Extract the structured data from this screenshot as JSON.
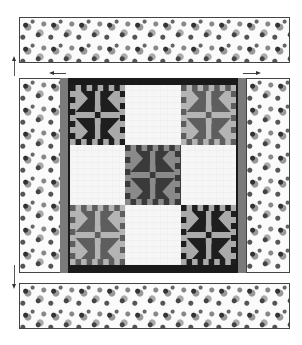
{
  "diagram": {
    "title": "",
    "colors": {
      "dark": "#1a1a1a",
      "medium": "#6f6f6f",
      "light": "#b0b0b0",
      "plain": "#f6f6f6",
      "sashing": "#7a7a7a"
    },
    "borders": {
      "top": {
        "label": "floral-border-top",
        "pattern": "floral print"
      },
      "bottom": {
        "label": "floral-border-bottom",
        "pattern": "floral print"
      },
      "left": {
        "label": "floral-border-left",
        "pattern": "floral print"
      },
      "right": {
        "label": "floral-border-right",
        "pattern": "floral print"
      }
    },
    "blocks": [
      {
        "row": 0,
        "col": 0,
        "type": "pieced",
        "tone": "dark"
      },
      {
        "row": 0,
        "col": 1,
        "type": "plain"
      },
      {
        "row": 0,
        "col": 2,
        "type": "pieced",
        "tone": "medium"
      },
      {
        "row": 1,
        "col": 0,
        "type": "plain"
      },
      {
        "row": 1,
        "col": 1,
        "type": "pieced",
        "tone": "medium-dark"
      },
      {
        "row": 1,
        "col": 2,
        "type": "plain"
      },
      {
        "row": 2,
        "col": 0,
        "type": "pieced",
        "tone": "medium"
      },
      {
        "row": 2,
        "col": 1,
        "type": "plain"
      },
      {
        "row": 2,
        "col": 2,
        "type": "pieced",
        "tone": "dark"
      }
    ],
    "arrows": [
      {
        "name": "arrow-up-left",
        "direction": "up"
      },
      {
        "name": "arrow-left-top",
        "direction": "left"
      },
      {
        "name": "arrow-right-top",
        "direction": "right"
      },
      {
        "name": "arrow-down-left",
        "direction": "down"
      }
    ]
  }
}
